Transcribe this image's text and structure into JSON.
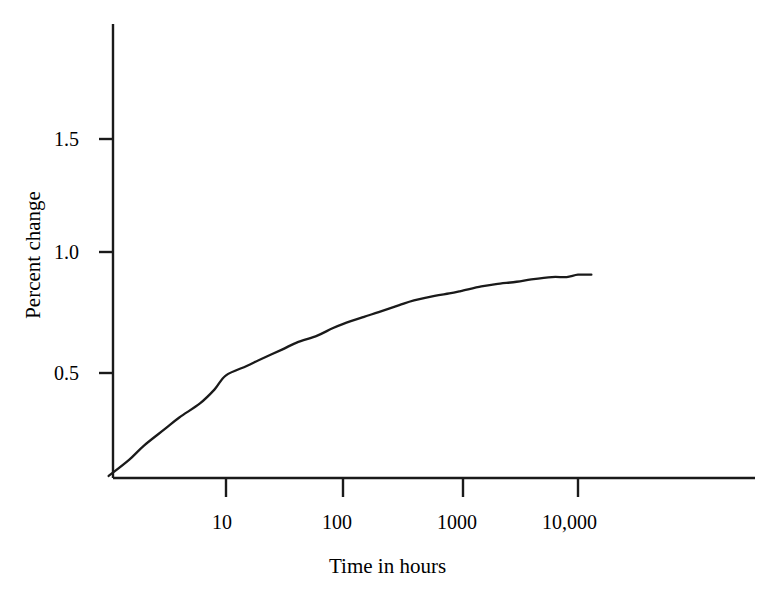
{
  "chart_data": {
    "type": "line",
    "title": "",
    "subtitle": "",
    "xlabel": "Time in hours",
    "ylabel": "Percent change",
    "xscale": "log",
    "yscale": "linear",
    "grid": false,
    "legend": null,
    "xlim": [
      1,
      100000
    ],
    "ylim": [
      0,
      1.78
    ],
    "xticks": [
      {
        "value": 10,
        "label": "10"
      },
      {
        "value": 100,
        "label": "100"
      },
      {
        "value": 1000,
        "label": "1000"
      },
      {
        "value": 10000,
        "label": "10,000"
      }
    ],
    "yticks": [
      {
        "value": 0.5,
        "label": "0.5"
      },
      {
        "value": 1.0,
        "label": "1.0"
      },
      {
        "value": 1.5,
        "label": "1.5"
      }
    ],
    "series": [
      {
        "name": "Percent change",
        "color": "#1a1a1a",
        "x": [
          1.0,
          1.5,
          2,
          3,
          4,
          6,
          8,
          10,
          15,
          20,
          30,
          40,
          60,
          80,
          100,
          150,
          200,
          300,
          400,
          600,
          800,
          1000,
          1500,
          2000,
          3000,
          4000,
          6000,
          8000,
          10000,
          13000
        ],
        "y": [
          0.06,
          0.13,
          0.19,
          0.26,
          0.31,
          0.37,
          0.43,
          0.49,
          0.53,
          0.56,
          0.6,
          0.63,
          0.66,
          0.69,
          0.71,
          0.74,
          0.76,
          0.79,
          0.81,
          0.83,
          0.84,
          0.85,
          0.87,
          0.88,
          0.89,
          0.9,
          0.91,
          0.91,
          0.92,
          0.92
        ]
      }
    ],
    "annotations": []
  },
  "axes": {
    "y_axis_label": "Percent change",
    "x_axis_label": "Time in hours",
    "ytick_labels": [
      "1.5",
      "1.0",
      "0.5"
    ],
    "xtick_labels": [
      "10",
      "100",
      "1000",
      "10,000"
    ]
  },
  "colors": {
    "background": "#ffffff",
    "axis": "#1a1a1a",
    "curve": "#1a1a1a",
    "text": "#000000"
  }
}
